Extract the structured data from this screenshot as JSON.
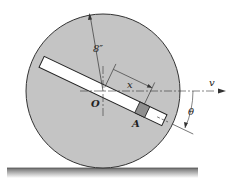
{
  "diagram": {
    "labels": {
      "radius": "8″",
      "center": "O",
      "block": "A",
      "distance": "x",
      "velocity": "v",
      "angle": "θ"
    },
    "colors": {
      "disk_fill": "#c4c4c4",
      "disk_stroke": "#333333",
      "slot_fill": "#ffffff",
      "block_fill": "#8f8f8f",
      "ground_fill": "#a8a8a8"
    }
  }
}
